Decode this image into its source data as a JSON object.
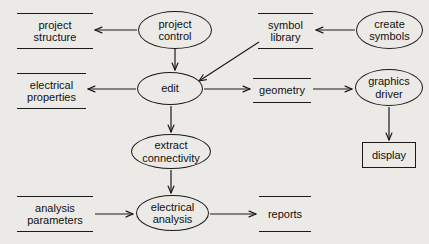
{
  "diagram": {
    "type": "data-flow-diagram",
    "background_color": "#eceae6",
    "stroke_color": "#1a1a1a",
    "text_color": "#111111",
    "nodes": [
      {
        "id": "project_structure",
        "label": "project\nstructure",
        "shape": "data-store",
        "x": 17,
        "y": 13,
        "w": 76,
        "h": 36
      },
      {
        "id": "project_control",
        "label": "project\ncontrol",
        "shape": "process",
        "x": 138,
        "y": 11,
        "w": 74,
        "h": 38
      },
      {
        "id": "symbol_library",
        "label": "symbol\nlibrary",
        "shape": "data-store",
        "x": 258,
        "y": 13,
        "w": 55,
        "h": 36
      },
      {
        "id": "create_symbols",
        "label": "create\nsymbols",
        "shape": "process",
        "x": 356,
        "y": 11,
        "w": 67,
        "h": 38
      },
      {
        "id": "electrical_properties",
        "label": "electrical\nproperties",
        "shape": "data-store",
        "x": 17,
        "y": 73,
        "w": 69,
        "h": 36
      },
      {
        "id": "edit",
        "label": "edit",
        "shape": "process",
        "x": 137,
        "y": 72,
        "w": 66,
        "h": 33
      },
      {
        "id": "geometry",
        "label": "geometry",
        "shape": "data-store",
        "x": 253,
        "y": 78,
        "w": 58,
        "h": 25
      },
      {
        "id": "graphics_driver",
        "label": "graphics\ndriver",
        "shape": "process",
        "x": 355,
        "y": 69,
        "w": 68,
        "h": 37
      },
      {
        "id": "display",
        "label": "display",
        "shape": "external-entity",
        "x": 362,
        "y": 142,
        "w": 54,
        "h": 26
      },
      {
        "id": "extract_connectivity",
        "label": "extract\nconnectivity",
        "shape": "process",
        "x": 131,
        "y": 134,
        "w": 80,
        "h": 35
      },
      {
        "id": "analysis_parameters",
        "label": "analysis\nparameters",
        "shape": "data-store",
        "x": 17,
        "y": 196,
        "w": 76,
        "h": 36
      },
      {
        "id": "electrical_analysis",
        "label": "electrical\nanalysis",
        "shape": "process",
        "x": 136,
        "y": 195,
        "w": 73,
        "h": 36
      },
      {
        "id": "reports",
        "label": "reports",
        "shape": "data-store",
        "x": 259,
        "y": 196,
        "w": 52,
        "h": 36
      }
    ],
    "edges": [
      {
        "id": "control_to_structure",
        "from": "project_control",
        "to": "project_structure",
        "path": "M 137 30 L 95 30",
        "arrow": "open"
      },
      {
        "id": "control_to_edit",
        "from": "project_control",
        "to": "edit",
        "path": "M 175 49 L 175 70",
        "arrow": "open"
      },
      {
        "id": "create_to_library",
        "from": "create_symbols",
        "to": "symbol_library",
        "path": "M 355 30 L 316 30",
        "arrow": "open"
      },
      {
        "id": "library_to_edit",
        "from": "symbol_library",
        "to": "edit",
        "path": "M 259 42 L 199 81",
        "arrow": "open"
      },
      {
        "id": "edit_to_properties",
        "from": "edit",
        "to": "electrical_properties",
        "path": "M 136 89 L 88 89",
        "arrow": "open"
      },
      {
        "id": "edit_to_geometry",
        "from": "edit",
        "to": "geometry",
        "path": "M 204 89 L 250 89",
        "arrow": "open"
      },
      {
        "id": "geometry_to_driver",
        "from": "geometry",
        "to": "graphics_driver",
        "path": "M 313 89 L 352 89",
        "arrow": "open"
      },
      {
        "id": "driver_to_display",
        "from": "graphics_driver",
        "to": "display",
        "path": "M 389 107 L 389 140",
        "arrow": "open"
      },
      {
        "id": "edit_to_extract",
        "from": "edit",
        "to": "extract_connectivity",
        "path": "M 171 106 L 171 132",
        "arrow": "open"
      },
      {
        "id": "extract_to_analysis",
        "from": "extract_connectivity",
        "to": "electrical_analysis",
        "path": "M 171 170 L 171 193",
        "arrow": "open"
      },
      {
        "id": "parameters_to_analysis",
        "from": "analysis_parameters",
        "to": "electrical_analysis",
        "path": "M 95 214 L 133 214",
        "arrow": "open"
      },
      {
        "id": "analysis_to_reports",
        "from": "electrical_analysis",
        "to": "reports",
        "path": "M 210 214 L 256 214",
        "arrow": "open"
      }
    ]
  }
}
